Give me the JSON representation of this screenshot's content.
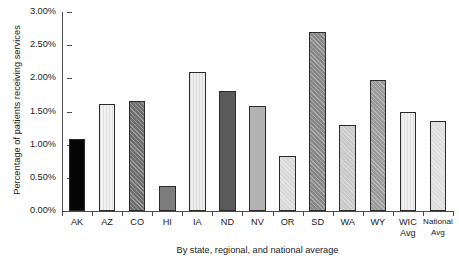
{
  "chart_data": {
    "type": "bar",
    "title": "",
    "xlabel": "By state, regional, and national average",
    "ylabel": "Percentage of patients receiving services",
    "categories": [
      "AK",
      "AZ",
      "CO",
      "HI",
      "IA",
      "ND",
      "NV",
      "OR",
      "SD",
      "WA",
      "WY",
      "WIC Avg",
      "National Avg"
    ],
    "category_lines": [
      [
        "AK"
      ],
      [
        "AZ"
      ],
      [
        "CO"
      ],
      [
        "HI"
      ],
      [
        "IA"
      ],
      [
        "ND"
      ],
      [
        "NV"
      ],
      [
        "OR"
      ],
      [
        "SD"
      ],
      [
        "WA"
      ],
      [
        "WY"
      ],
      [
        "WIC",
        "Avg"
      ],
      [
        "National",
        "Avg"
      ]
    ],
    "values": [
      1.09,
      1.61,
      1.66,
      0.37,
      2.09,
      1.81,
      1.59,
      0.83,
      2.7,
      1.29,
      1.97,
      1.49,
      1.35
    ],
    "value_labels": [
      "1.09%",
      "1.61%",
      "1.66%",
      "0.37%",
      "2.09%",
      "1.81%",
      "1.59%",
      "0.83%",
      "2.70%",
      "1.29%",
      "1.97%",
      "1.49%",
      "1.35%"
    ],
    "ylim": [
      0,
      3.0
    ],
    "ytick_values": [
      0.0,
      0.5,
      1.0,
      1.5,
      2.0,
      2.5,
      3.0
    ],
    "ytick_labels": [
      "0.00%",
      "0.50%",
      "1.00%",
      "1.50%",
      "2.00%",
      "2.50%",
      "3.00%"
    ],
    "grid": false,
    "legend": "none",
    "bar_fills": [
      "#050505",
      "#f2f2f2",
      "#6e6e6e",
      "#7d7d7d",
      "#ededed",
      "#5a5a5a",
      "#b3b3b3",
      "#d9d9d9",
      "#878787",
      "#c9c9c9",
      "#9a9a9a",
      "#f0f0f0",
      "#dedede"
    ],
    "bar_hatch": [
      "none",
      "vertical",
      "diagonal",
      "none",
      "vertical",
      "none",
      "none",
      "diagonal",
      "diagonal",
      "diagonal",
      "diagonal",
      "vertical",
      "diagonal"
    ],
    "axis_color": "#4d4d4d",
    "bar_edge_color": "#2b2b2b",
    "text_color": "#1a1a1a",
    "background": "#ffffff"
  }
}
